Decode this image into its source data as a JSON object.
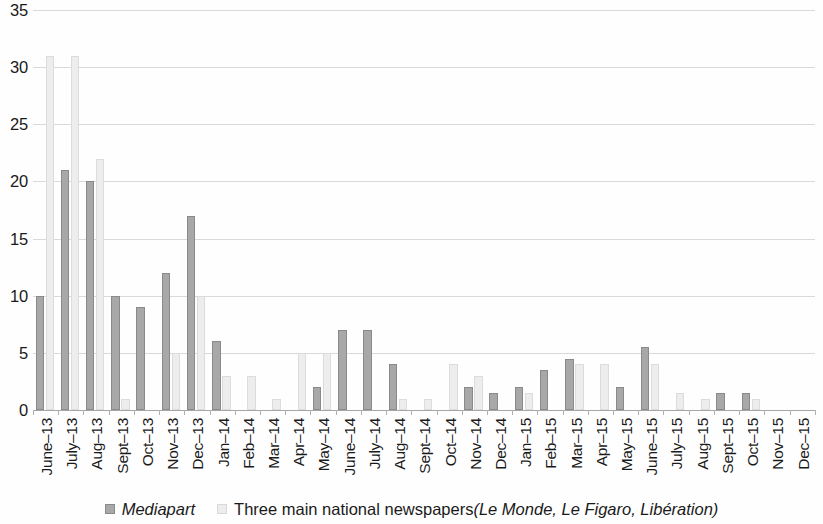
{
  "chart_data": {
    "type": "bar",
    "title": "",
    "subtitle": "",
    "xlabel": "",
    "ylabel": "",
    "ylim": [
      0,
      35
    ],
    "yticks": [
      0,
      5,
      10,
      15,
      20,
      25,
      30,
      35
    ],
    "grid": true,
    "legend_position": "bottom",
    "categories": [
      "June-13",
      "July-13",
      "Aug-13",
      "Sept-13",
      "Oct-13",
      "Nov-13",
      "Dec-13",
      "Jan-14",
      "Feb-14",
      "Mar-14",
      "Apr-14",
      "May-14",
      "June-14",
      "July-14",
      "Aug-14",
      "Sept-14",
      "Oct-14",
      "Nov-14",
      "Dec-14",
      "Jan-15",
      "Feb-15",
      "Mar-15",
      "Apr-15",
      "May-15",
      "June-15",
      "July-15",
      "Aug-15",
      "Sept-15",
      "Oct-15",
      "Nov-15",
      "Dec-15"
    ],
    "series": [
      {
        "name": "Mediapart",
        "color": "#a8a8a8",
        "values": [
          10,
          21,
          20,
          10,
          9,
          12,
          17,
          6,
          0,
          0,
          0,
          2,
          7,
          7,
          4,
          0,
          0,
          2,
          1.5,
          2,
          3.5,
          4.5,
          0,
          2,
          5.5,
          0,
          0,
          1.5,
          1.5,
          0,
          0
        ]
      },
      {
        "name": "Three main national newspapers (Le Monde, Le Figaro, Libération)",
        "color": "#ededed",
        "values": [
          31,
          31,
          22,
          1,
          0,
          5,
          10,
          3,
          3,
          1,
          5,
          5,
          0,
          0,
          1,
          1,
          4,
          3,
          0,
          1.5,
          0,
          4,
          4,
          0,
          4,
          1.5,
          1,
          0,
          1,
          0,
          0
        ]
      }
    ]
  },
  "legend": {
    "items": [
      {
        "label": "Mediapart",
        "style": "italic",
        "swatch": "mediapart"
      },
      {
        "label": "Three main national newspapers ",
        "style": "normal",
        "swatch": "newspapers"
      }
    ],
    "newspapers_names": "(Le Monde, Le Figaro, Libération)"
  }
}
